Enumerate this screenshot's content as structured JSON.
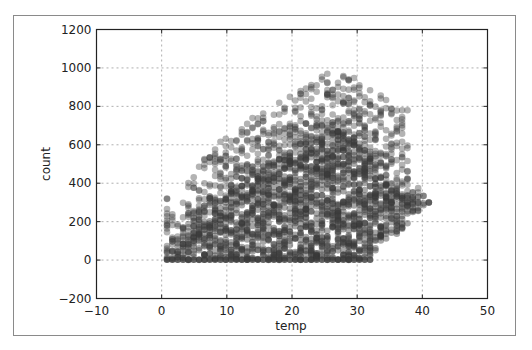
{
  "chart_data": {
    "type": "scatter",
    "title": "",
    "xlabel": "temp",
    "ylabel": "count",
    "xlim": [
      -10,
      50
    ],
    "ylim": [
      -200,
      1200
    ],
    "xticks": [
      -10,
      0,
      10,
      20,
      30,
      40,
      50
    ],
    "yticks": [
      -200,
      0,
      200,
      400,
      600,
      800,
      1000,
      1200
    ],
    "xtick_labels": [
      "−10",
      "0",
      "10",
      "20",
      "30",
      "40",
      "50"
    ],
    "ytick_labels": [
      "−200",
      "0",
      "200",
      "400",
      "600",
      "800",
      "1000",
      "1200"
    ],
    "grid": true,
    "legend": null,
    "marker": {
      "shape": "circle",
      "color": "#3a3a3a",
      "alpha": 0.45,
      "radius_px": 3.3
    },
    "temp_step": 0.82,
    "envelope": [
      {
        "temp": 0.82,
        "min": 0,
        "dense_max": 20,
        "max": 320
      },
      {
        "temp": 2.46,
        "min": 0,
        "dense_max": 90,
        "max": 210
      },
      {
        "temp": 4.1,
        "min": 0,
        "dense_max": 150,
        "max": 420
      },
      {
        "temp": 5.74,
        "min": 0,
        "dense_max": 200,
        "max": 500
      },
      {
        "temp": 8.2,
        "min": 0,
        "dense_max": 270,
        "max": 600
      },
      {
        "temp": 10.66,
        "min": 0,
        "dense_max": 350,
        "max": 660
      },
      {
        "temp": 12.3,
        "min": 0,
        "dense_max": 400,
        "max": 700
      },
      {
        "temp": 14.76,
        "min": 0,
        "dense_max": 440,
        "max": 760
      },
      {
        "temp": 16.4,
        "min": 0,
        "dense_max": 470,
        "max": 800
      },
      {
        "temp": 18.04,
        "min": 0,
        "dense_max": 500,
        "max": 830
      },
      {
        "temp": 20.5,
        "min": 0,
        "dense_max": 550,
        "max": 880
      },
      {
        "temp": 22.14,
        "min": 0,
        "dense_max": 600,
        "max": 910
      },
      {
        "temp": 24.6,
        "min": 0,
        "dense_max": 620,
        "max": 960
      },
      {
        "temp": 26.24,
        "min": 0,
        "dense_max": 660,
        "max": 985
      },
      {
        "temp": 28.7,
        "min": 0,
        "dense_max": 650,
        "max": 970
      },
      {
        "temp": 30.34,
        "min": 0,
        "dense_max": 620,
        "max": 940
      },
      {
        "temp": 31.98,
        "min": 10,
        "dense_max": 520,
        "max": 890
      },
      {
        "temp": 33.62,
        "min": 90,
        "dense_max": 420,
        "max": 870
      },
      {
        "temp": 35.26,
        "min": 120,
        "dense_max": 360,
        "max": 800
      },
      {
        "temp": 36.9,
        "min": 150,
        "dense_max": 320,
        "max": 780
      },
      {
        "temp": 38.54,
        "min": 230,
        "dense_max": 300,
        "max": 450
      },
      {
        "temp": 41.0,
        "min": 300,
        "dense_max": 300,
        "max": 300
      }
    ]
  }
}
